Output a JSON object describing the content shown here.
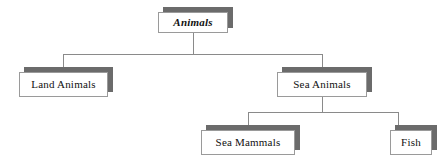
{
  "diagram": {
    "type": "hierarchy-tree",
    "background_color": "#ffffff",
    "line_color": "#8a8a8a",
    "box_fill": "#ffffff",
    "box_border": "#9a9a9a",
    "shadow_color": "#6b6b6b",
    "text_color": "#111111",
    "nodes": [
      {
        "id": "animals",
        "label": "Animals",
        "level": 0,
        "style": "bold-italic",
        "x": 158,
        "y": 12,
        "width": 70,
        "height": 21
      },
      {
        "id": "land-animals",
        "label": "Land Animals",
        "level": 1,
        "style": "regular",
        "x": 19,
        "y": 72,
        "width": 89,
        "height": 25
      },
      {
        "id": "sea-animals",
        "label": "Sea Animals",
        "level": 1,
        "style": "regular",
        "x": 277,
        "y": 72,
        "width": 90,
        "height": 25
      },
      {
        "id": "sea-mammals",
        "label": "Sea Mammals",
        "level": 2,
        "style": "regular",
        "x": 201,
        "y": 130,
        "width": 94,
        "height": 25
      },
      {
        "id": "fish",
        "label": "Fish",
        "level": 2,
        "style": "regular",
        "x": 390,
        "y": 130,
        "width": 42,
        "height": 25
      }
    ],
    "edges": [
      {
        "from": "animals",
        "to": "land-animals"
      },
      {
        "from": "animals",
        "to": "sea-animals"
      },
      {
        "from": "sea-animals",
        "to": "sea-mammals"
      },
      {
        "from": "sea-animals",
        "to": "fish"
      }
    ]
  }
}
